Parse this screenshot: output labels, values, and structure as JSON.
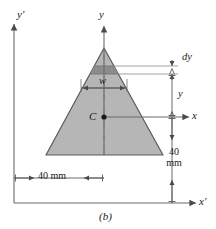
{
  "figure": {
    "caption": "(b)",
    "shape": "triangle",
    "fill_color": "#b6b6b6",
    "strip_color": "#8c8c8c",
    "stroke_color": "#555555",
    "axes": [
      {
        "name": "y-axis",
        "label": "y",
        "orientation": "vertical",
        "origin": "centroid"
      },
      {
        "name": "x-axis",
        "label": "x",
        "orientation": "horizontal",
        "origin": "centroid"
      },
      {
        "name": "y-prime-axis",
        "label": "y′",
        "orientation": "vertical",
        "origin": "base-left"
      },
      {
        "name": "x-prime-axis",
        "label": "x′",
        "orientation": "horizontal",
        "origin": "base-left"
      }
    ],
    "labels": {
      "centroid": "C",
      "strip_width": "w",
      "strip_thickness": "dy",
      "strip_height": "y"
    },
    "dimensions": {
      "base_width": "40 mm",
      "height_line1": "40",
      "height_line2": "mm"
    }
  }
}
